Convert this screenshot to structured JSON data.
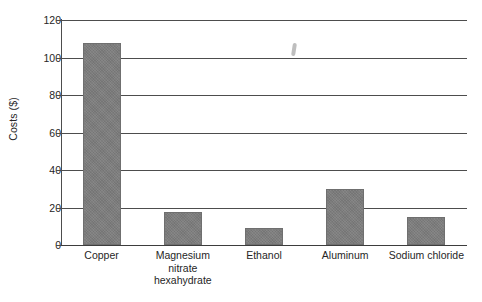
{
  "chart_data": {
    "type": "bar",
    "title": "",
    "xlabel": "",
    "ylabel": "Costs ($)",
    "categories": [
      "Copper",
      "Magnesium nitrate hexahydrate",
      "Ethanol",
      "Aluminum",
      "Sodium chloride"
    ],
    "category_lines": [
      [
        "Copper"
      ],
      [
        "Magnesium",
        "nitrate",
        "hexahydrate"
      ],
      [
        "Ethanol"
      ],
      [
        "Aluminum"
      ],
      [
        "Sodium chloride"
      ]
    ],
    "values": [
      108,
      17.5,
      9,
      30,
      15
    ],
    "ylim": [
      0,
      120
    ],
    "ytick_labels": [
      "0",
      "20",
      "40",
      "60",
      "80",
      "100",
      "120"
    ],
    "ytick_values": [
      0,
      20,
      40,
      60,
      80,
      100,
      120
    ],
    "grid": true,
    "legend": null,
    "bar_color": "#7d7d7d",
    "axis_color": "#4d4d4d",
    "background": "#ffffff"
  },
  "annotations": {
    "scan_artifact": "smudge-mark"
  }
}
